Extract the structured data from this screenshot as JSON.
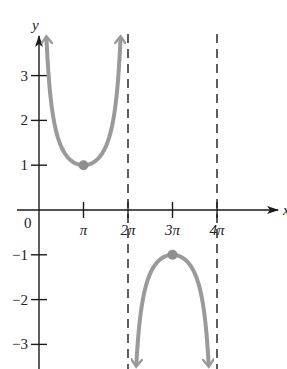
{
  "chart_data": {
    "type": "line",
    "title": "",
    "function": "y = csc(x/2)",
    "xlabel": "x",
    "ylabel": "y",
    "xlim": [
      0,
      4.6
    ],
    "ylim": [
      -3.6,
      3.9
    ],
    "x_unit": "pi",
    "x_ticks": [
      {
        "value": 1,
        "label": "π"
      },
      {
        "value": 2,
        "label": "2π"
      },
      {
        "value": 3,
        "label": "3π"
      },
      {
        "value": 4,
        "label": "4π"
      }
    ],
    "y_ticks": [
      {
        "value": 3,
        "label": "3"
      },
      {
        "value": 2,
        "label": "2"
      },
      {
        "value": 1,
        "label": "1"
      },
      {
        "value": -1,
        "label": "−1"
      },
      {
        "value": -2,
        "label": "−2"
      },
      {
        "value": -3,
        "label": "−3"
      }
    ],
    "origin_label": "0",
    "asymptotes_x": [
      2,
      4
    ],
    "series": [
      {
        "name": "upper branch",
        "x_range": [
          0.168,
          1.832
        ],
        "points": [
          [
            0.168,
            3.85
          ],
          [
            0.5,
            2.61
          ],
          [
            1,
            1
          ],
          [
            1.5,
            1.08
          ],
          [
            1.832,
            3.85
          ]
        ],
        "extreme": {
          "x": 1,
          "y": 1,
          "type": "minimum"
        }
      },
      {
        "name": "lower branch",
        "x_range": [
          2.187,
          3.813
        ],
        "points": [
          [
            2.187,
            -3.45
          ],
          [
            2.5,
            -1.41
          ],
          [
            3,
            -1
          ],
          [
            3.5,
            -1.41
          ],
          [
            3.813,
            -3.45
          ]
        ],
        "extreme": {
          "x": 3,
          "y": -1,
          "type": "maximum"
        }
      }
    ],
    "grid": false,
    "legend": null,
    "colors": {
      "curve": "#9a9a9a",
      "axis": "#1a1a1a",
      "asymptote": "#1a1a1a",
      "point": "#8f8f8f"
    }
  }
}
